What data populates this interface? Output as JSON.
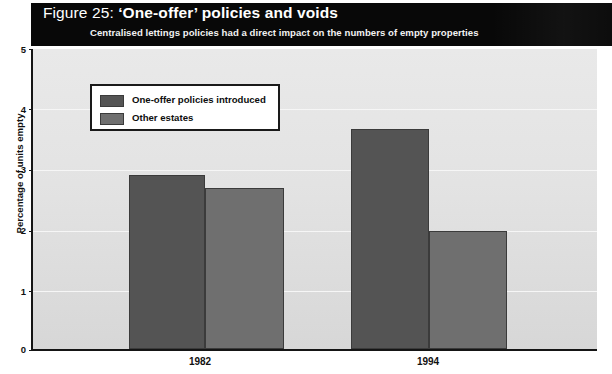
{
  "figure": {
    "title_prefix": "Figure 25: ",
    "title_main": "‘One-offer’ policies and voids",
    "subtitle": "Centralised lettings policies had a direct impact on the numbers of empty properties"
  },
  "legend": {
    "items": [
      {
        "label": "One-offer policies introduced",
        "color": "#545454"
      },
      {
        "label": "Other estates",
        "color": "#6f6f6f"
      }
    ]
  },
  "axis": {
    "y_ticks": [
      "5",
      "4",
      "3",
      "2",
      "1",
      "0"
    ],
    "x_ticks": [
      "1982",
      "1994"
    ]
  },
  "chart_data": {
    "type": "bar",
    "title": "Figure 25: ‘One-offer’ policies and voids",
    "subtitle": "Centralised lettings policies had a direct impact on the numbers of empty properties",
    "categories": [
      "1982",
      "1994"
    ],
    "series": [
      {
        "name": "One-offer policies introduced",
        "color": "#545454",
        "values": [
          2.9,
          3.67
        ]
      },
      {
        "name": "Other estates",
        "color": "#6f6f6f",
        "values": [
          2.68,
          1.96
        ]
      }
    ],
    "xlabel": "",
    "ylabel": "Percentage of units empty",
    "ylim": [
      0,
      5
    ],
    "ytick_step": 1,
    "grid": true,
    "legend_position": "upper-left-inside"
  }
}
